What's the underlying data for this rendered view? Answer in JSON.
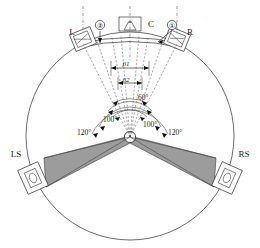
{
  "figure": {
    "type": "diagram"
  },
  "speakers": {
    "left": {
      "label": "L",
      "name": "left-front-speaker"
    },
    "center": {
      "label": "C",
      "name": "center-speaker"
    },
    "right": {
      "label": "R",
      "name": "right-front-speaker"
    },
    "left_surround": {
      "label": "LS",
      "name": "left-surround-speaker"
    },
    "right_surround": {
      "label": "RS",
      "name": "right-surround-speaker"
    }
  },
  "callouts": {
    "one": "①",
    "two": "②"
  },
  "angles": {
    "beta1": "β1",
    "beta2": "β2",
    "screen_span": "60°",
    "surround_inner_left": "100°",
    "surround_inner_right": "100°",
    "surround_outer_left": "120°",
    "surround_outer_right": "120°"
  },
  "colors": {
    "zone_fill": "#9c9c9c",
    "line": "#2b2b2b",
    "background": "#ffffff"
  }
}
